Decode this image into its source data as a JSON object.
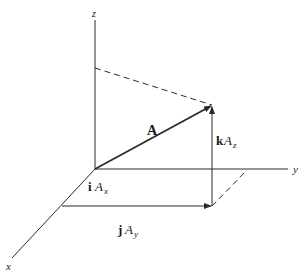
{
  "diagram": {
    "type": "vector-components-3d",
    "axes": {
      "x_label": "x",
      "y_label": "y",
      "z_label": "z"
    },
    "vector": {
      "label": "A"
    },
    "components": {
      "x": {
        "unit": "i",
        "magnitude": "A",
        "subscript": "x"
      },
      "y": {
        "unit": "j",
        "magnitude": "A",
        "subscript": "y"
      },
      "z": {
        "unit": "k",
        "magnitude": "A",
        "subscript": "z"
      }
    },
    "colors": {
      "line": "#2a2a2a",
      "text": "#1a1a1a",
      "background": "#ffffff"
    }
  }
}
